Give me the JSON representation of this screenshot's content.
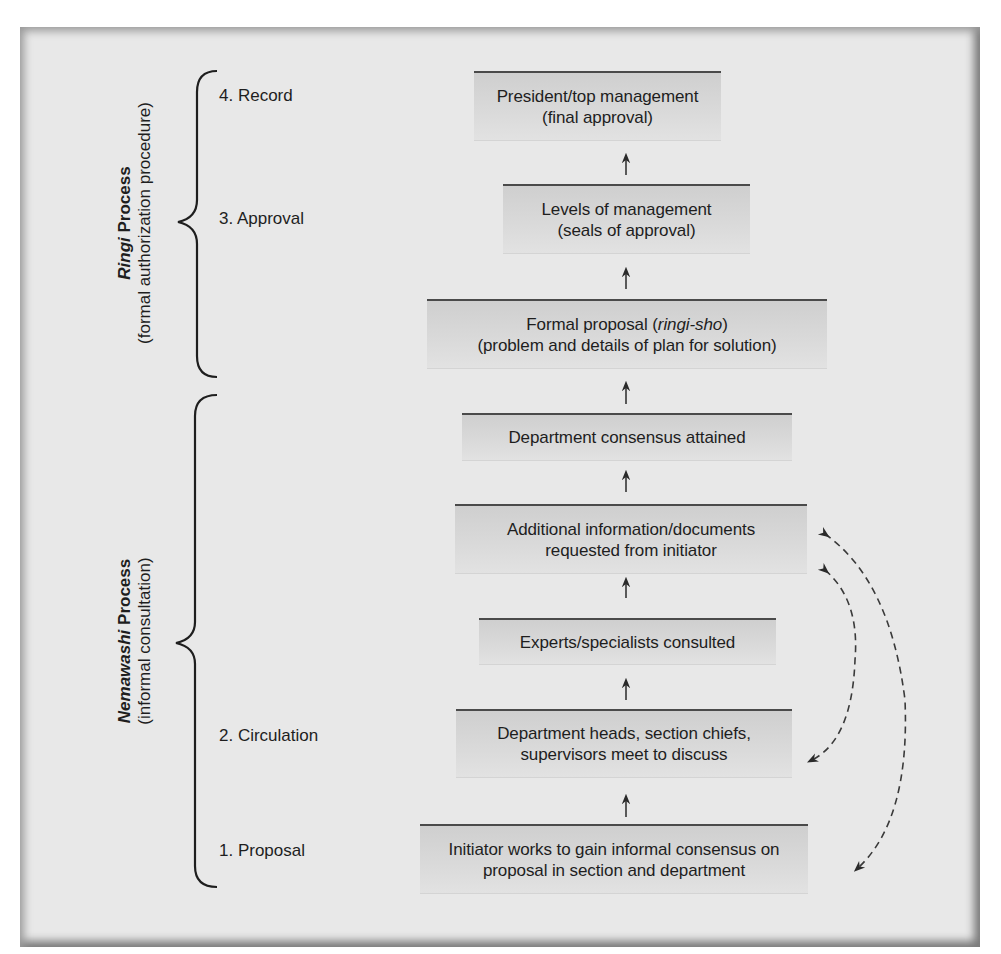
{
  "diagram": {
    "groups": [
      {
        "id": "ringi",
        "title_italic": "Ringi",
        "title_rest": " Process",
        "subtitle": "(formal authorization procedure)"
      },
      {
        "id": "nemawashi",
        "title_italic": "Nemawashi",
        "title_rest": " Process",
        "subtitle": "(informal consultation)"
      }
    ],
    "stages": [
      {
        "label": "4. Record"
      },
      {
        "label": "3. Approval"
      },
      {
        "label": "2. Circulation"
      },
      {
        "label": "1. Proposal"
      }
    ],
    "boxes": [
      {
        "line1": "President/top management",
        "line2": "(final approval)"
      },
      {
        "line1": "Levels of management",
        "line2": "(seals of approval)"
      },
      {
        "line1_pre": "Formal proposal (",
        "line1_italic": "ringi-sho",
        "line1_post": ")",
        "line2": "(problem and details of plan for solution)"
      },
      {
        "line1": "Department consensus attained"
      },
      {
        "line1": "Additional information/documents",
        "line2": "requested from initiator"
      },
      {
        "line1": "Experts/specialists consulted"
      },
      {
        "line1": "Department heads, section chiefs,",
        "line2": "supervisors meet to discuss"
      },
      {
        "line1": "Initiator works to gain informal consensus on",
        "line2": "proposal in section and department"
      }
    ],
    "edges": [
      {
        "from": "Initiator works to gain informal consensus",
        "to": "Department heads meet",
        "style": "solid"
      },
      {
        "from": "Department heads meet",
        "to": "Experts/specialists consulted",
        "style": "solid"
      },
      {
        "from": "Experts/specialists consulted",
        "to": "Additional information/documents",
        "style": "solid"
      },
      {
        "from": "Additional information/documents",
        "to": "Department consensus attained",
        "style": "solid"
      },
      {
        "from": "Department consensus attained",
        "to": "Formal proposal (ringi-sho)",
        "style": "solid"
      },
      {
        "from": "Formal proposal (ringi-sho)",
        "to": "Levels of management",
        "style": "solid"
      },
      {
        "from": "Levels of management",
        "to": "President/top management",
        "style": "solid"
      },
      {
        "from": "Additional information/documents",
        "to": "Department heads meet",
        "style": "dashed-bidirectional"
      },
      {
        "from": "Additional information/documents",
        "to": "Initiator works to gain informal consensus",
        "style": "dashed-bidirectional"
      }
    ],
    "colors": {
      "panel_bg": "#e8e8e8",
      "box_bg": "#d4d4d4",
      "box_top_border": "#4a4a4a",
      "text": "#1e1e1e"
    }
  }
}
